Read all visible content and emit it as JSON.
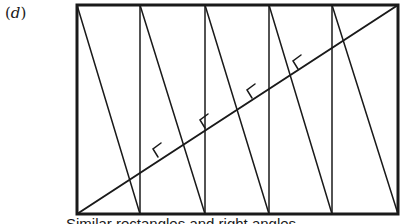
{
  "figure": {
    "label_open": "(",
    "label_letter": "d",
    "label_close": ")",
    "caption": "Similar rectangles and right angles",
    "rect": {
      "x1": 77,
      "y1": 5,
      "x2": 398,
      "y2": 214
    },
    "verticals_x": [
      140,
      205,
      269,
      332
    ],
    "slanted_lines": [
      {
        "from": [
          77,
          5
        ],
        "to": [
          140,
          214
        ]
      },
      {
        "from": [
          140,
          5
        ],
        "to": [
          205,
          214
        ]
      },
      {
        "from": [
          205,
          5
        ],
        "to": [
          269,
          214
        ]
      },
      {
        "from": [
          269,
          5
        ],
        "to": [
          332,
          214
        ]
      },
      {
        "from": [
          332,
          5
        ],
        "to": [
          398,
          214
        ]
      }
    ],
    "main_diagonal": {
      "from": [
        77,
        214
      ],
      "to": [
        398,
        5
      ]
    },
    "right_angle_marks": [
      {
        "at": [
          167,
          155
        ]
      },
      {
        "at": [
          214,
          125
        ]
      },
      {
        "at": [
          261,
          95
        ]
      },
      {
        "at": [
          307,
          66
        ]
      }
    ],
    "stroke_color": "#1a1a1a",
    "background": "#ffffff"
  }
}
